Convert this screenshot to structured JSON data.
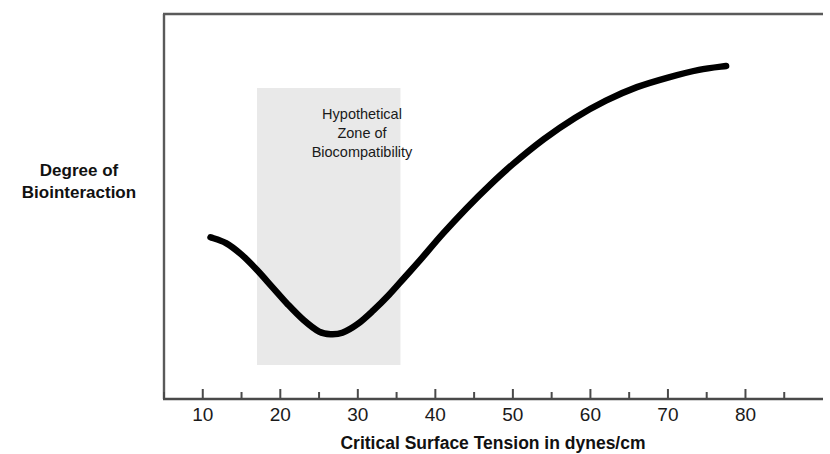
{
  "chart_data": {
    "type": "line",
    "title": "",
    "xlabel": "Critical Surface Tension in dynes/cm",
    "ylabel": "Degree of Biointeraction",
    "ylabel_lines": [
      "Degree of",
      "Biointeraction"
    ],
    "xlim": [
      5,
      90
    ],
    "ylim": [
      0,
      100
    ],
    "x_major_ticks": [
      10,
      20,
      30,
      40,
      50,
      60,
      70,
      80
    ],
    "x_minor_ticks": [
      5,
      15,
      25,
      35,
      45,
      55,
      65,
      75,
      85
    ],
    "x_tick_labels": [
      "10",
      "20",
      "30",
      "40",
      "50",
      "60",
      "70",
      "80"
    ],
    "y_ticks": [],
    "y_tick_labels": [],
    "grid": false,
    "legend": false,
    "series": [
      {
        "name": "Degree of Biointeraction",
        "color": "#000000",
        "x": [
          11.0,
          13.0,
          15.0,
          17.0,
          19.0,
          21.0,
          23.0,
          25.0,
          26.5,
          28.0,
          30.0,
          32.0,
          34.0,
          36.0,
          38.0,
          41.0,
          44.0,
          47.0,
          50.0,
          54.0,
          58.0,
          62.0,
          66.0,
          70.0,
          74.0,
          77.5
        ],
        "y": [
          42.0,
          40.5,
          37.5,
          33.5,
          29.0,
          24.5,
          20.5,
          17.5,
          16.8,
          17.2,
          19.5,
          23.0,
          27.0,
          31.5,
          36.0,
          43.0,
          49.5,
          55.5,
          61.0,
          67.5,
          73.0,
          77.5,
          81.0,
          83.5,
          85.5,
          86.5
        ]
      }
    ],
    "annotations": [
      {
        "text": "Hypothetical Zone of Biocompatibility",
        "lines": [
          "Hypothetical",
          "Zone of",
          "Biocompatibility"
        ],
        "type": "shaded-band",
        "x_start": 17.0,
        "x_end": 35.5,
        "fill": "#e9e9e9"
      }
    ],
    "colors": {
      "curve": "#000000",
      "band": "#e9e9e9",
      "axis": "#4a4a4a",
      "background": "#ffffff"
    }
  }
}
